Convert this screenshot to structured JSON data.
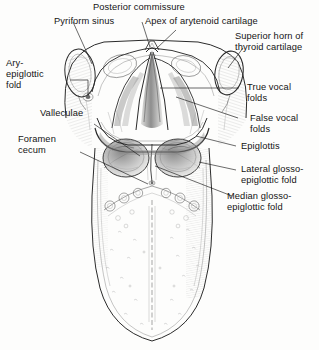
{
  "figure": {
    "style": "pen-and-ink line drawing, grayscale",
    "background_color": "#fdfdfc",
    "ink_color": "#2a2a2a",
    "width": 319,
    "height": 350
  },
  "labels": [
    {
      "id": "pyriform-sinus",
      "text": "Pyriform sinus",
      "lines": [
        "Pyriform sinus"
      ]
    },
    {
      "id": "posterior-commissure",
      "text": "Posterior commissure",
      "lines": [
        "Posterior commissure"
      ]
    },
    {
      "id": "apex-arytenoid-cartilage",
      "text": "Apex of arytenoid cartilage",
      "lines": [
        "Apex of arytenoid cartilage"
      ]
    },
    {
      "id": "superior-horn-thyroid",
      "text": "Superior horn of thyroid cartilage",
      "line1": "Superior horn of",
      "line2": "thyroid cartilage"
    },
    {
      "id": "ary-epiglottic-fold",
      "text": "Ary-epiglottic fold",
      "line1": "Ary-",
      "line2": "epiglottic",
      "line3": "fold"
    },
    {
      "id": "true-vocal-folds",
      "text": "True vocal folds",
      "line1": "True vocal",
      "line2": "folds"
    },
    {
      "id": "false-vocal-folds",
      "text": "False vocal folds",
      "line1": "False vocal",
      "line2": "folds"
    },
    {
      "id": "valleculae",
      "text": "Valleculae",
      "lines": [
        "Valleculae"
      ]
    },
    {
      "id": "epiglottis",
      "text": "Epiglottis",
      "lines": [
        "Epiglottis"
      ]
    },
    {
      "id": "foramen-cecum",
      "text": "Foramen cecum",
      "line1": "Foramen",
      "line2": "cecum"
    },
    {
      "id": "lateral-glosso-epiglottic-fold",
      "text": "Lateral glosso-epiglottic fold",
      "line1": "Lateral glosso-",
      "line2": "epiglottic fold"
    },
    {
      "id": "median-glosso-epiglottic-fold",
      "text": "Median glosso-epiglottic fold",
      "line1": "Median glosso-",
      "line2": "epiglottic fold"
    }
  ],
  "structures": [
    "pyriform sinus",
    "posterior commissure",
    "apex of arytenoid cartilage",
    "superior horn of thyroid cartilage",
    "ary-epiglottic fold",
    "true vocal folds",
    "false vocal folds",
    "valleculae",
    "epiglottis",
    "foramen cecum",
    "lateral glosso-epiglottic fold",
    "median glosso-epiglottic fold",
    "circumvallate papillae",
    "median sulcus of tongue",
    "body of tongue"
  ]
}
